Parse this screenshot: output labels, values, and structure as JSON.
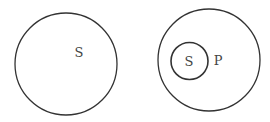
{
  "diagrams": [
    {
      "name": "left-venn",
      "circles": [
        {
          "cx": 66,
          "cy": 64,
          "r": 51
        }
      ],
      "labels": [
        {
          "text": "S",
          "x": 79,
          "y": 57
        }
      ]
    },
    {
      "name": "right-venn",
      "circles": [
        {
          "cx": 209,
          "cy": 60,
          "r": 51
        },
        {
          "cx": 189.5,
          "cy": 61,
          "r": 18.5
        }
      ],
      "labels": [
        {
          "text": "S",
          "x": 189,
          "y": 66
        },
        {
          "text": "P",
          "x": 218,
          "y": 65
        }
      ]
    }
  ],
  "colors": {
    "stroke": "#333333",
    "text": "#444444"
  }
}
